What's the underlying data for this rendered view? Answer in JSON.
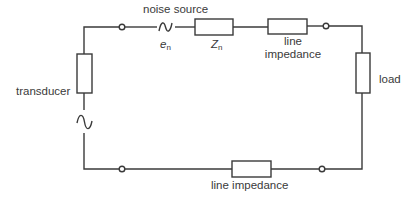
{
  "diagram": {
    "type": "circuit",
    "labels": {
      "noise_source": "noise source",
      "en_main": "e",
      "en_sub": "n",
      "zn_main": "Z",
      "zn_sub": "n",
      "line_impedance_top_1": "line",
      "line_impedance_top_2": "impedance",
      "load": "load",
      "transducer": "transducer",
      "line_impedance_bottom": "line impedance"
    },
    "components": [
      {
        "id": "transducer-resistor",
        "kind": "impedance"
      },
      {
        "id": "transducer-source",
        "kind": "ac-source"
      },
      {
        "id": "noise-source",
        "kind": "ac-source",
        "symbol": "e_n"
      },
      {
        "id": "noise-impedance",
        "kind": "impedance",
        "symbol": "Z_n"
      },
      {
        "id": "line-impedance-top",
        "kind": "impedance"
      },
      {
        "id": "load",
        "kind": "impedance"
      },
      {
        "id": "line-impedance-bottom",
        "kind": "impedance"
      }
    ],
    "terminals": 4,
    "colors": {
      "line": "#3a3a3a",
      "background": "#ffffff"
    }
  }
}
